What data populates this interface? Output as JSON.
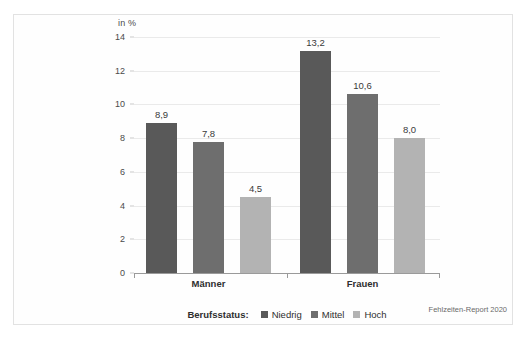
{
  "chart_data": {
    "type": "bar",
    "title": "",
    "xlabel": "",
    "ylabel": "in %",
    "ylim": [
      0,
      14
    ],
    "yticks": [
      0,
      2,
      4,
      6,
      8,
      10,
      12,
      14
    ],
    "ytick_labels": [
      "0",
      "2",
      "4",
      "6",
      "8",
      "10",
      "12",
      "14"
    ],
    "grid": true,
    "legend_position": "bottom",
    "legend_title": "Berufsstatus:",
    "categories": [
      "Männer",
      "Frauen"
    ],
    "series": [
      {
        "name": "Niedrig",
        "color": "#595959",
        "values": [
          8.9,
          13.2
        ],
        "value_labels": [
          "8,9",
          "13,2"
        ]
      },
      {
        "name": "Mittel",
        "color": "#6e6e6e",
        "values": [
          7.8,
          10.6
        ],
        "value_labels": [
          "7,8",
          "10,6"
        ]
      },
      {
        "name": "Hoch",
        "color": "#b3b3b3",
        "values": [
          4.5,
          8.0
        ],
        "value_labels": [
          "4,5",
          "8,0"
        ]
      }
    ],
    "source_note": "Fehlzeiten-Report 2020"
  }
}
